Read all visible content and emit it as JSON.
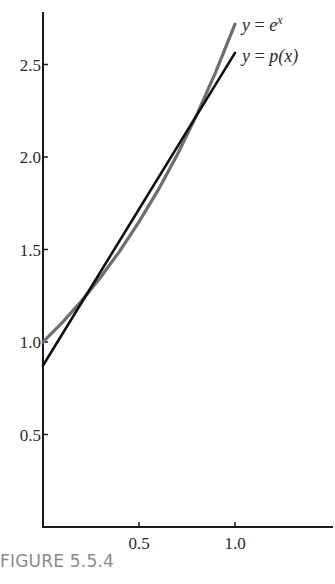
{
  "chart_data": {
    "type": "line",
    "title": "",
    "xlabel": "",
    "ylabel": "",
    "xlim": [
      0,
      1.5
    ],
    "ylim": [
      0,
      2.8
    ],
    "grid": false,
    "x_ticks": [
      0.5,
      1.0
    ],
    "x_tick_labels": [
      "0.5",
      "1.0"
    ],
    "y_ticks": [
      0.5,
      1.0,
      1.5,
      2.0,
      2.5
    ],
    "y_tick_labels": [
      "0.5",
      "1.0",
      "1.5",
      "2.0",
      "2.5"
    ],
    "series": [
      {
        "name": "y = e^x",
        "color": "#6e6e6e",
        "x": [
          0,
          0.1,
          0.2,
          0.3,
          0.4,
          0.5,
          0.6,
          0.7,
          0.8,
          0.9,
          1.0
        ],
        "values": [
          1.0,
          1.105,
          1.221,
          1.35,
          1.492,
          1.649,
          1.822,
          2.014,
          2.226,
          2.46,
          2.718
        ]
      },
      {
        "name": "y = p(x)",
        "color": "#111111",
        "x": [
          0,
          1.0
        ],
        "values": [
          0.873,
          2.563
        ]
      }
    ],
    "legend": {
      "position": "inline-right-of-line-ends",
      "entries": [
        {
          "prefix": "y = ",
          "body": "e",
          "sup": "x"
        },
        {
          "prefix": "y = ",
          "body": "p(x)",
          "sup": ""
        }
      ]
    }
  },
  "caption": "FIGURE 5.5.4"
}
